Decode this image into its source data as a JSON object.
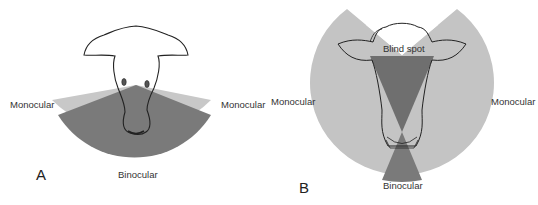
{
  "figure": {
    "panel_a": {
      "letter": "A",
      "labels": {
        "monocular_left": "Monocular",
        "monocular_right": "Monocular",
        "binocular": "Binocular"
      }
    },
    "panel_b": {
      "letter": "B",
      "labels": {
        "monocular_left": "Monocular",
        "monocular_right": "Monocular",
        "binocular": "Binocular",
        "blind_spot": "Blind spot"
      }
    },
    "colors": {
      "monocular": "#c4c4c4",
      "binocular": "#7a7a7a",
      "outline": "#222222",
      "background": "#ffffff"
    }
  }
}
